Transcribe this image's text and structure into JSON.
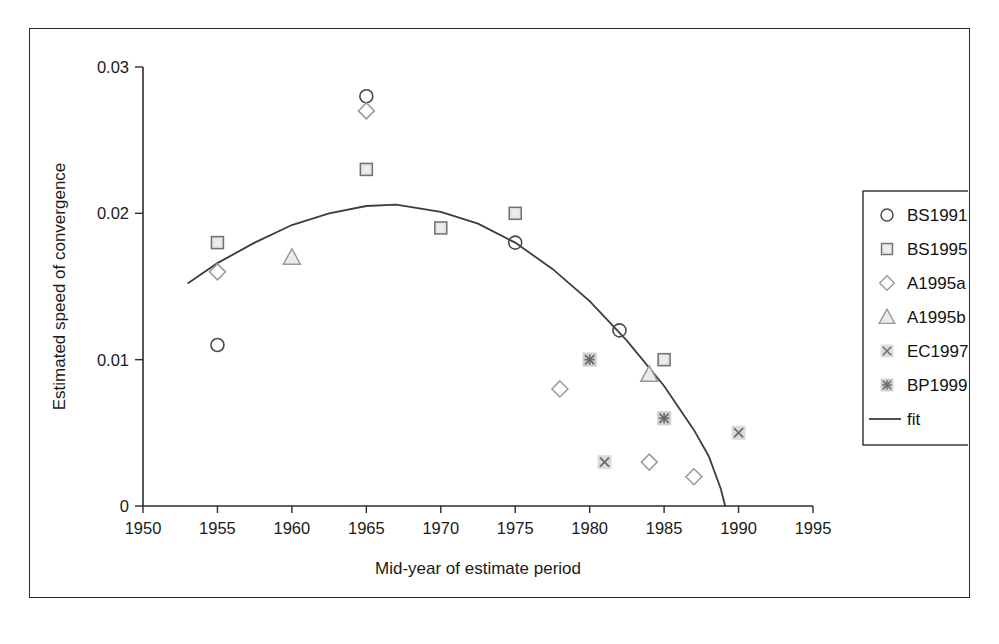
{
  "figure": {
    "name": "scatter-plot-speed-of-convergence"
  },
  "chart_data": {
    "type": "scatter",
    "title": "",
    "xlabel": "Mid-year of estimate period",
    "ylabel": "Estimated speed of convergence",
    "xlim": [
      1950,
      1995
    ],
    "ylim": [
      0,
      0.03
    ],
    "xticks": [
      "1950",
      "1955",
      "1960",
      "1965",
      "1970",
      "1975",
      "1980",
      "1985",
      "1990",
      "1995"
    ],
    "xtick_values": [
      1950,
      1955,
      1960,
      1965,
      1970,
      1975,
      1980,
      1985,
      1990,
      1995
    ],
    "yticks": [
      "0",
      "0.01",
      "0.02",
      "0.03"
    ],
    "ytick_values": [
      0,
      0.01,
      0.02,
      0.03
    ],
    "grid": false,
    "legend_position": "right-outside",
    "series": [
      {
        "name": "BS1991",
        "marker": "circle-open",
        "color": "#4a4a4a",
        "points": [
          {
            "x": 1955,
            "y": 0.011
          },
          {
            "x": 1965,
            "y": 0.028
          },
          {
            "x": 1975,
            "y": 0.018
          },
          {
            "x": 1982,
            "y": 0.012
          }
        ]
      },
      {
        "name": "BS1995",
        "marker": "square-pale",
        "color": "#6e6e6e",
        "points": [
          {
            "x": 1955,
            "y": 0.018
          },
          {
            "x": 1965,
            "y": 0.023
          },
          {
            "x": 1970,
            "y": 0.019
          },
          {
            "x": 1975,
            "y": 0.02
          },
          {
            "x": 1985,
            "y": 0.01
          }
        ]
      },
      {
        "name": "A1995a",
        "marker": "diamond-open",
        "color": "#9a9a9a",
        "points": [
          {
            "x": 1955,
            "y": 0.016
          },
          {
            "x": 1965,
            "y": 0.027
          },
          {
            "x": 1978,
            "y": 0.008
          },
          {
            "x": 1984,
            "y": 0.003
          },
          {
            "x": 1987,
            "y": 0.002
          }
        ]
      },
      {
        "name": "A1995b",
        "marker": "triangle-pale",
        "color": "#9a9a9a",
        "points": [
          {
            "x": 1960,
            "y": 0.017
          },
          {
            "x": 1984,
            "y": 0.009
          }
        ]
      },
      {
        "name": "EC1997",
        "marker": "x-in-square",
        "color": "#8c8c8c",
        "points": [
          {
            "x": 1980,
            "y": 0.01
          },
          {
            "x": 1981,
            "y": 0.003
          },
          {
            "x": 1985,
            "y": 0.006
          },
          {
            "x": 1990,
            "y": 0.005
          }
        ]
      },
      {
        "name": "BP1999",
        "marker": "star-in-square",
        "color": "#8c8c8c",
        "points": [
          {
            "x": 1980,
            "y": 0.01
          },
          {
            "x": 1985,
            "y": 0.006
          }
        ]
      }
    ],
    "fit": {
      "name": "fit",
      "type": "line",
      "description": "quadratic fit curve peaking near 1966 at 0.0205 and crossing zero near 1989",
      "points": [
        {
          "x": 1953.0,
          "y": 0.0152
        },
        {
          "x": 1955.0,
          "y": 0.0166
        },
        {
          "x": 1957.5,
          "y": 0.018
        },
        {
          "x": 1960.0,
          "y": 0.0192
        },
        {
          "x": 1962.5,
          "y": 0.02
        },
        {
          "x": 1965.0,
          "y": 0.0205
        },
        {
          "x": 1967.0,
          "y": 0.0206
        },
        {
          "x": 1970.0,
          "y": 0.0201
        },
        {
          "x": 1972.5,
          "y": 0.0193
        },
        {
          "x": 1975.0,
          "y": 0.018
        },
        {
          "x": 1977.5,
          "y": 0.0162
        },
        {
          "x": 1980.0,
          "y": 0.014
        },
        {
          "x": 1982.5,
          "y": 0.0113
        },
        {
          "x": 1985.0,
          "y": 0.0082
        },
        {
          "x": 1987.0,
          "y": 0.0052
        },
        {
          "x": 1988.0,
          "y": 0.0034
        },
        {
          "x": 1988.8,
          "y": 0.0012
        },
        {
          "x": 1989.1,
          "y": 0.0
        }
      ]
    },
    "legend_entries": [
      {
        "label": "BS1991",
        "marker": "circle-open"
      },
      {
        "label": "BS1995",
        "marker": "square-pale"
      },
      {
        "label": "A1995a",
        "marker": "diamond-open"
      },
      {
        "label": "A1995b",
        "marker": "triangle-pale"
      },
      {
        "label": "EC1997",
        "marker": "x-in-square"
      },
      {
        "label": "BP1999",
        "marker": "star-in-square"
      },
      {
        "label": "fit",
        "marker": "line"
      }
    ]
  },
  "axes": {
    "x_title": "Mid-year of estimate period",
    "y_title": "Estimated speed of convergence"
  },
  "legend": {
    "items": [
      {
        "label": "BS1991"
      },
      {
        "label": "BS1995"
      },
      {
        "label": "A1995a"
      },
      {
        "label": "A1995b"
      },
      {
        "label": "EC1997"
      },
      {
        "label": "BP1999"
      },
      {
        "label": "fit"
      }
    ]
  },
  "colors": {
    "axis": "#2b2b2b",
    "fit_line": "#3d3d3d",
    "marker_open": "#4a4a4a",
    "marker_pale": "#9a9a9a",
    "marker_fill": "#e2e2e2",
    "background": "#ffffff"
  }
}
